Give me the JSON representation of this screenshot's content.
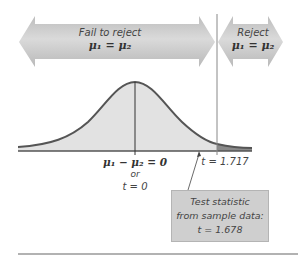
{
  "regions": {
    "fail_to_reject": {
      "title": "Fail to reject",
      "equation": "μ₁ = μ₂"
    },
    "reject": {
      "title": "Reject",
      "equation": "μ₁ = μ₂"
    }
  },
  "axis_labels": {
    "center_line1": "μ₁ − μ₂ = 0",
    "center_or": "or",
    "center_line2": "t = 0",
    "critical": "t = 1.717"
  },
  "test_statistic_box": {
    "line1": "Test statistic",
    "line2": "from sample data:",
    "line3": "t = 1.678"
  },
  "colors": {
    "arrow_fill": "#cdcdcd",
    "curve_fill": "#e2e2e2",
    "reject_tail_fill": "#8a8a8a",
    "curve_stroke": "#555555"
  }
}
